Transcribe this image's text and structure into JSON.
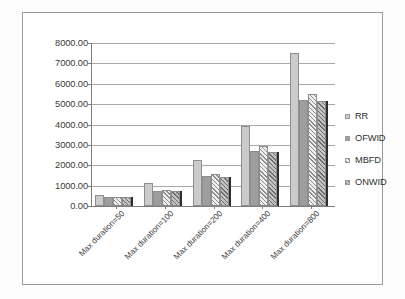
{
  "chart_data": {
    "type": "bar",
    "title": "",
    "subtitle": "",
    "xlabel": "",
    "ylabel": "",
    "ylim": [
      0,
      8000
    ],
    "ytick_step": 1000,
    "ytick_labels": [
      "8000.00",
      "7000.00",
      "6000.00",
      "5000.00",
      "4000.00",
      "3000.00",
      "2000.00",
      "1000.00",
      "0.00"
    ],
    "grid": true,
    "legend_position": "right",
    "categories": [
      "Max duration=50",
      "Max duration=100",
      "Max duration=200",
      "Max duration=400",
      "Max duration=800"
    ],
    "series": [
      {
        "name": "RR",
        "color": "#cbcbcb",
        "pattern": "solid",
        "values": [
          540,
          1130,
          2270,
          3950,
          7500
        ]
      },
      {
        "name": "OFWID",
        "color": "#9e9e9e",
        "pattern": "solid",
        "values": [
          420,
          760,
          1450,
          2680,
          5180
        ]
      },
      {
        "name": "MBFD",
        "color": "#efefef",
        "pattern": "hatch-light",
        "values": [
          450,
          790,
          1580,
          2960,
          5490
        ]
      },
      {
        "name": "ONWID",
        "color": "#c2c2c2",
        "pattern": "hatch-dark",
        "values": [
          420,
          730,
          1440,
          2650,
          5140
        ]
      }
    ]
  },
  "legend": {
    "items": [
      {
        "label": "RR"
      },
      {
        "label": "OFWID"
      },
      {
        "label": "MBFD"
      },
      {
        "label": "ONWID"
      }
    ]
  }
}
